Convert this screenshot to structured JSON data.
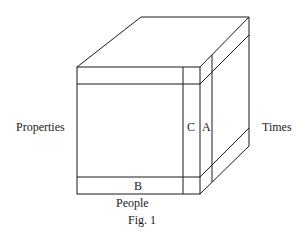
{
  "figure": {
    "caption": "Fig. 1",
    "axes": {
      "left": "Properties",
      "bottom": "People",
      "right": "Times"
    },
    "slices": {
      "a": "A",
      "b": "B",
      "c": "C"
    },
    "colors": {
      "line": "#1a1a1a",
      "background": "#ffffff"
    }
  }
}
